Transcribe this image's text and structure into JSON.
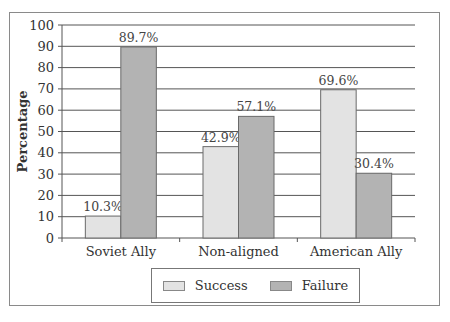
{
  "chart_data": {
    "type": "bar",
    "title": "",
    "xlabel": "",
    "ylabel": "Percentage",
    "ylim": [
      0,
      100
    ],
    "yticks": [
      0,
      10,
      20,
      30,
      40,
      50,
      60,
      70,
      80,
      90,
      100
    ],
    "grid": true,
    "categories": [
      "Soviet Ally",
      "Non-aligned",
      "American Ally"
    ],
    "series": [
      {
        "name": "Success",
        "values": [
          10.3,
          42.9,
          69.6
        ],
        "labels": [
          "10.3%",
          "42.9%",
          "69.6%"
        ],
        "color": "#e3e3e3"
      },
      {
        "name": "Failure",
        "values": [
          89.7,
          57.1,
          30.4
        ],
        "labels": [
          "89.7%",
          "57.1%",
          "30.4%"
        ],
        "color": "#b3b3b3"
      }
    ],
    "legend_position": "bottom"
  },
  "legend": {
    "items": [
      {
        "label": "Success",
        "color": "#e3e3e3"
      },
      {
        "label": "Failure",
        "color": "#b3b3b3"
      }
    ]
  }
}
